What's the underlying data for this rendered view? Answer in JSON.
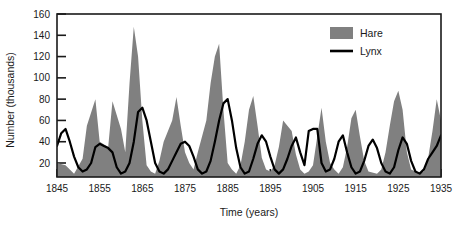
{
  "chart_data": {
    "type": "area",
    "title": "",
    "xlabel": "Time (years)",
    "ylabel": "Number (thousands)",
    "xlim": [
      1845,
      1935
    ],
    "ylim": [
      0,
      160
    ],
    "xticks": [
      1845,
      1855,
      1865,
      1875,
      1885,
      1895,
      1905,
      1915,
      1925,
      1935
    ],
    "yticks": [
      20,
      40,
      60,
      80,
      100,
      120,
      140,
      160
    ],
    "grid": false,
    "legend_position": "top-right",
    "series": [
      {
        "name": "Hare",
        "type": "area",
        "color": "#808080",
        "x": [
          1845,
          1847,
          1849,
          1851,
          1852,
          1854,
          1855,
          1857,
          1858,
          1860,
          1861,
          1862,
          1863,
          1864,
          1865,
          1866,
          1867,
          1868,
          1869,
          1870,
          1872,
          1873,
          1874,
          1875,
          1876,
          1877,
          1878,
          1880,
          1881,
          1882,
          1883,
          1884,
          1885,
          1886,
          1887,
          1888,
          1889,
          1890,
          1891,
          1892,
          1893,
          1894,
          1895,
          1896,
          1897,
          1898,
          1900,
          1901,
          1902,
          1903,
          1904,
          1905,
          1906,
          1907,
          1908,
          1909,
          1910,
          1911,
          1912,
          1913,
          1914,
          1915,
          1916,
          1917,
          1918,
          1920,
          1921,
          1922,
          1923,
          1924,
          1925,
          1926,
          1927,
          1928,
          1930,
          1931,
          1932,
          1933,
          1934,
          1935
        ],
        "values": [
          20,
          18,
          10,
          24,
          55,
          80,
          40,
          35,
          78,
          52,
          30,
          95,
          148,
          120,
          60,
          18,
          12,
          10,
          22,
          40,
          60,
          82,
          55,
          30,
          20,
          14,
          30,
          60,
          95,
          120,
          132,
          70,
          20,
          14,
          10,
          18,
          40,
          70,
          83,
          55,
          25,
          14,
          12,
          18,
          35,
          60,
          50,
          28,
          14,
          10,
          12,
          18,
          45,
          72,
          40,
          20,
          14,
          10,
          16,
          35,
          62,
          70,
          45,
          22,
          12,
          10,
          14,
          30,
          55,
          78,
          88,
          70,
          30,
          14,
          10,
          12,
          25,
          50,
          80,
          60
        ]
      },
      {
        "name": "Lynx",
        "type": "line",
        "color": "#000000",
        "x": [
          1845,
          1846,
          1847,
          1848,
          1849,
          1850,
          1851,
          1852,
          1853,
          1854,
          1855,
          1856,
          1857,
          1858,
          1859,
          1860,
          1861,
          1862,
          1863,
          1864,
          1865,
          1866,
          1867,
          1868,
          1869,
          1870,
          1871,
          1872,
          1873,
          1874,
          1875,
          1876,
          1877,
          1878,
          1879,
          1880,
          1881,
          1882,
          1883,
          1884,
          1885,
          1886,
          1887,
          1888,
          1889,
          1890,
          1891,
          1892,
          1893,
          1894,
          1895,
          1896,
          1897,
          1898,
          1899,
          1900,
          1901,
          1902,
          1903,
          1904,
          1905,
          1906,
          1907,
          1908,
          1909,
          1910,
          1911,
          1912,
          1913,
          1914,
          1915,
          1916,
          1917,
          1918,
          1919,
          1920,
          1921,
          1922,
          1923,
          1924,
          1925,
          1926,
          1927,
          1928,
          1929,
          1930,
          1931,
          1932,
          1933,
          1934,
          1935
        ],
        "values": [
          36,
          48,
          52,
          40,
          26,
          16,
          12,
          14,
          20,
          35,
          38,
          36,
          34,
          30,
          16,
          10,
          12,
          20,
          40,
          68,
          72,
          60,
          40,
          20,
          12,
          10,
          14,
          22,
          30,
          38,
          40,
          36,
          26,
          14,
          10,
          12,
          22,
          40,
          60,
          76,
          80,
          60,
          34,
          16,
          10,
          12,
          24,
          38,
          46,
          40,
          26,
          14,
          10,
          14,
          24,
          36,
          44,
          30,
          18,
          50,
          52,
          52,
          20,
          12,
          14,
          24,
          40,
          46,
          30,
          16,
          10,
          12,
          22,
          36,
          42,
          34,
          20,
          12,
          10,
          16,
          32,
          44,
          38,
          22,
          12,
          10,
          14,
          24,
          30,
          36,
          46
        ]
      }
    ],
    "legend": [
      {
        "label": "Hare",
        "marker": "filled-swatch",
        "color": "#808080"
      },
      {
        "label": "Lynx",
        "marker": "line",
        "color": "#000000"
      }
    ]
  },
  "plot": {
    "frame_color": "#1a1a1a",
    "background": "#ffffff"
  }
}
